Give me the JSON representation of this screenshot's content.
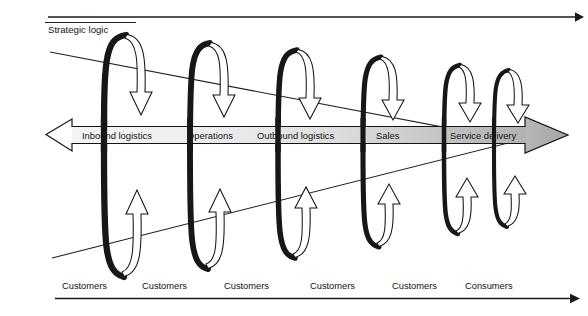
{
  "figure": {
    "title_label": "Strategic logic",
    "top_axis": {
      "name": "strategic-logic-axis",
      "direction": "right"
    },
    "bottom_axis": {
      "name": "customers-axis",
      "direction": "right"
    }
  },
  "value_chain": {
    "name": "value-chain-band",
    "left_arrow_fill": "#ffffff",
    "right_arrow_fill": "#b3b3b3",
    "gradient_from": "#f2f2f2",
    "gradient_to": "#b0b0b0",
    "stages": [
      {
        "label": "Inbound logistics",
        "x": 123
      },
      {
        "label": "Operations",
        "x": 215
      },
      {
        "label": "Outbound logistics",
        "x": 305
      },
      {
        "label": "Sales",
        "x": 392
      },
      {
        "label": "Service delivery",
        "x": 480
      }
    ]
  },
  "loops": {
    "name": "feedback-loops",
    "stroke_dark": "#171717",
    "arrow_fill": "#ffffff",
    "items": [
      {
        "cx": 124,
        "rx": 16,
        "top": 33,
        "bottom": 277,
        "sw": 6.2
      },
      {
        "cx": 209,
        "rx": 15,
        "top": 41,
        "bottom": 268,
        "sw": 5.8
      },
      {
        "cx": 296,
        "rx": 14,
        "top": 48,
        "bottom": 256,
        "sw": 5.4
      },
      {
        "cx": 380,
        "rx": 13,
        "top": 56,
        "bottom": 243,
        "sw": 5.0
      },
      {
        "cx": 459,
        "rx": 11,
        "top": 64,
        "bottom": 230,
        "sw": 4.4
      },
      {
        "cx": 508,
        "rx": 10,
        "top": 69,
        "bottom": 222,
        "sw": 4.0
      }
    ]
  },
  "customers_row": {
    "name": "customers-row",
    "items": [
      {
        "label": "Customers",
        "x": 62
      },
      {
        "label": "Customers",
        "x": 142
      },
      {
        "label": "Customers",
        "x": 224
      },
      {
        "label": "Customers",
        "x": 310
      },
      {
        "label": "Customers",
        "x": 392
      },
      {
        "label": "Consumers",
        "x": 465
      }
    ]
  },
  "converging_lines": {
    "name": "convergence-guides",
    "upper": {
      "x1": 50,
      "y1": 52,
      "x2": 516,
      "y2": 141
    },
    "lower": {
      "x1": 52,
      "y1": 258,
      "x2": 516,
      "y2": 141
    }
  }
}
